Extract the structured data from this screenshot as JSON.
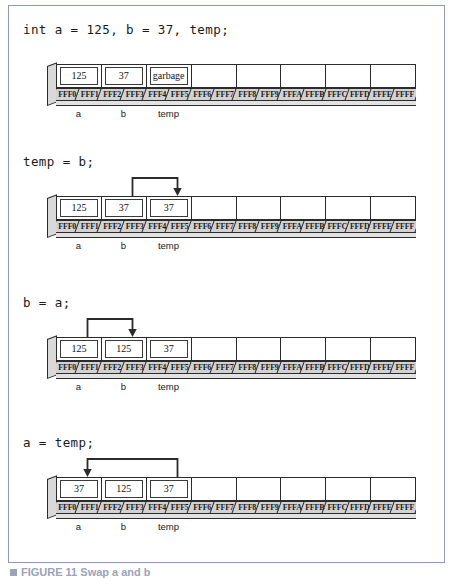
{
  "figure": {
    "caption_marker": "",
    "caption": "FIGURE 11 Swap a and b",
    "border_color": "#8f9bbd"
  },
  "memory": {
    "addresses": [
      "FFF0",
      "FFF1",
      "FFF2",
      "FFF3",
      "FFF4",
      "FFF5",
      "FFF6",
      "FFF7",
      "FFF8",
      "FFF9",
      "FFFA",
      "FFFB",
      "FFFC",
      "FFFD",
      "FFFE",
      "FFFF"
    ],
    "cell_count": 8,
    "variable_labels": [
      "a",
      "b",
      "temp",
      "",
      "",
      "",
      "",
      ""
    ],
    "strip_color": "#d2d2d2",
    "line_color": "#2b2b2b"
  },
  "panels": [
    {
      "code": "int a = 125, b = 37, temp;",
      "values": [
        "125",
        "37",
        "garbage",
        "",
        "",
        "",
        "",
        ""
      ],
      "arrow": null
    },
    {
      "code": "temp = b;",
      "values": [
        "125",
        "37",
        "37",
        "",
        "",
        "",
        "",
        ""
      ],
      "arrow": {
        "from_cell": 1,
        "to_cell": 2,
        "direction": "right"
      }
    },
    {
      "code": "b = a;",
      "values": [
        "125",
        "125",
        "37",
        "",
        "",
        "",
        "",
        ""
      ],
      "arrow": {
        "from_cell": 0,
        "to_cell": 1,
        "direction": "right"
      }
    },
    {
      "code": "a = temp;",
      "values": [
        "37",
        "125",
        "37",
        "",
        "",
        "",
        "",
        ""
      ],
      "arrow": {
        "from_cell": 2,
        "to_cell": 0,
        "direction": "left"
      }
    }
  ]
}
